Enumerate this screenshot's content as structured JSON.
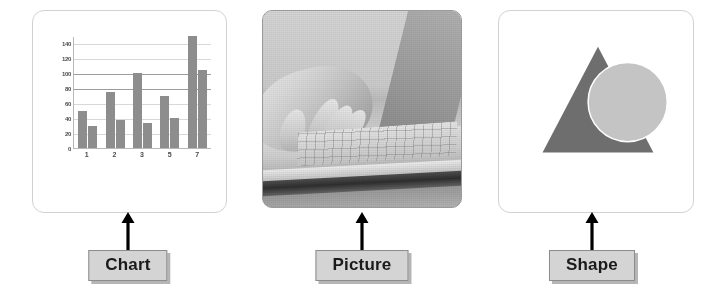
{
  "panels": [
    {
      "id": "chart",
      "label": "Chart",
      "arrow_icon": "arrow-up-icon"
    },
    {
      "id": "picture",
      "label": "Picture",
      "arrow_icon": "arrow-up-icon",
      "image_description": "grayscale photo of a hand typing on a laptop keyboard"
    },
    {
      "id": "shape",
      "label": "Shape",
      "arrow_icon": "arrow-up-icon",
      "shapes": [
        {
          "name": "triangle",
          "color": "#6e6e6e"
        },
        {
          "name": "circle",
          "color": "#c4c4c4"
        }
      ]
    }
  ],
  "colors": {
    "bar": "#8d8d8d",
    "label_box_fill": "#d4d4d4",
    "label_box_border": "#8c8c8c",
    "panel_border": "#d2d2d2",
    "arrow": "#000000",
    "triangle": "#6e6e6e",
    "circle": "#c4c4c4",
    "gridline": "#d8d8d8",
    "axis": "#b8b8b8"
  },
  "chart_data": {
    "type": "bar",
    "title": "",
    "xlabel": "",
    "ylabel": "",
    "categories": [
      "1",
      "2",
      "3",
      "5",
      "7"
    ],
    "series": [
      {
        "name": "Series 1",
        "values": [
          50,
          75,
          100,
          70,
          150
        ]
      },
      {
        "name": "Series 2",
        "values": [
          30,
          37,
          33,
          40,
          105
        ]
      }
    ],
    "ylim": [
      0,
      150
    ],
    "yticks": [
      0,
      20,
      40,
      60,
      80,
      100,
      120,
      140
    ],
    "ytick_labels": [
      "0",
      "20",
      "40",
      "60",
      "80",
      "100",
      "120",
      "140"
    ],
    "grid": true,
    "legend": false
  }
}
